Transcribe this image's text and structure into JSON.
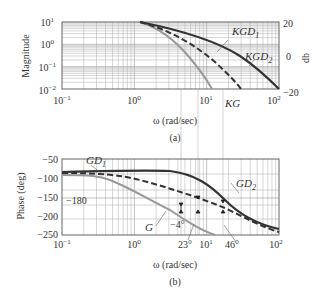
{
  "chart_data": [
    {
      "panel": "(a)",
      "type": "line",
      "xscale": "log",
      "yscale": "log",
      "xlabel": "ω (rad/sec)",
      "ylabel": "Magnitude",
      "y2label": "db",
      "xlim": [
        0.1,
        100
      ],
      "ylim": [
        0.01,
        10
      ],
      "y2lim": [
        -20,
        20
      ],
      "x_ticks": [
        "10^-1",
        "10^0",
        "10^1",
        "10^2"
      ],
      "y_ticks": [
        "10^-2",
        "10^-1",
        "10^0",
        "10^1"
      ],
      "y2_ticks": [
        "-20",
        "0",
        "20"
      ],
      "grid": true,
      "series": [
        {
          "name": "KG",
          "style": "solid-gray",
          "x": [
            1.2,
            2,
            3,
            5,
            8,
            12,
            18
          ],
          "y": [
            10,
            6,
            3.2,
            1.2,
            0.35,
            0.1,
            0.01
          ]
        },
        {
          "name": "KGD1",
          "style": "dashed-dark",
          "x": [
            1.2,
            2,
            4,
            8,
            15,
            25,
            40
          ],
          "y": [
            10,
            7,
            3.5,
            1.2,
            0.35,
            0.08,
            0.01
          ]
        },
        {
          "name": "KGD2",
          "style": "solid-dark",
          "x": [
            1.2,
            2,
            4,
            10,
            20,
            40,
            100
          ],
          "y": [
            10,
            8,
            5,
            2.5,
            0.7,
            0.12,
            0.01
          ]
        }
      ],
      "annotations": [
        "KGD1",
        "KGD2",
        "KG"
      ],
      "caption": "(a)"
    },
    {
      "panel": "(b)",
      "type": "line",
      "xscale": "log",
      "xlabel": "ω (rad/sec)",
      "ylabel": "Phase (deg)",
      "xlim": [
        0.1,
        100
      ],
      "ylim": [
        -250,
        -50
      ],
      "x_ticks": [
        "10^-1",
        "10^0",
        "10^1",
        "10^2"
      ],
      "y_ticks": [
        "-50",
        "-100",
        "-150",
        "-200",
        "-250"
      ],
      "grid": true,
      "reference_line": {
        "label": "-180",
        "y": -180
      },
      "series": [
        {
          "name": "G",
          "style": "solid-gray",
          "x": [
            0.1,
            0.3,
            0.5,
            1,
            2,
            4,
            8,
            15
          ],
          "y": [
            -92,
            -95,
            -105,
            -130,
            -160,
            -200,
            -230,
            -250
          ]
        },
        {
          "name": "GD1",
          "style": "dashed-dark",
          "x": [
            0.1,
            0.3,
            1,
            2,
            5,
            10,
            20,
            50,
            100
          ],
          "y": [
            -90,
            -90,
            -100,
            -112,
            -135,
            -160,
            -190,
            -230,
            -245
          ]
        },
        {
          "name": "GD2",
          "style": "solid-dark",
          "x": [
            0.1,
            0.5,
            1.5,
            3,
            6,
            12,
            25,
            50,
            100
          ],
          "y": [
            -88,
            -86,
            -85,
            -90,
            -110,
            -150,
            -195,
            -225,
            -240
          ]
        }
      ],
      "annotations": [
        "GD1",
        "GD2",
        "G",
        "-4°",
        "23°",
        "46°"
      ],
      "caption": "(b)"
    }
  ],
  "labels": {
    "mag_ylabel": "Magnitude",
    "mag_y2label": "db",
    "phase_ylabel": "Phase (deg)",
    "xlabel": "ω (rad/sec)",
    "caption_a": "(a)",
    "caption_b": "(b)",
    "kgd1": "KGD",
    "kgd1_sub": "1",
    "kgd2": "KGD",
    "kgd2_sub": "2",
    "kg": "KG",
    "gd1": "GD",
    "gd1_sub": "1",
    "gd2": "GD",
    "gd2_sub": "2",
    "g": "G",
    "m180": "−180",
    "pm_neg4": "−4°",
    "pm_23": "23°",
    "pm_46": "46°",
    "mag_ticks": [
      "10",
      "10",
      "10",
      "10"
    ],
    "mag_tick_exps": [
      "1",
      "0",
      "−1",
      "−2"
    ],
    "db_ticks": [
      "20",
      "0",
      "−20"
    ],
    "phase_ticks": [
      "−50",
      "−100",
      "−150",
      "−200",
      "−250"
    ],
    "x_ticks_base": "10",
    "x_tick_exps": [
      "−1",
      "0",
      "1",
      "2"
    ]
  }
}
